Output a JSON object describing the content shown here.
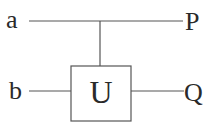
{
  "diagram": {
    "type": "quantum-circuit",
    "inputs": [
      {
        "id": "a",
        "label": "a"
      },
      {
        "id": "b",
        "label": "b"
      }
    ],
    "outputs": [
      {
        "id": "P",
        "label": "P"
      },
      {
        "id": "Q",
        "label": "Q"
      }
    ],
    "gate": {
      "label": "U",
      "control": "a",
      "target": "b"
    },
    "colors": {
      "line": "#555555",
      "text": "#2a2a2a",
      "background": "#ffffff"
    }
  }
}
